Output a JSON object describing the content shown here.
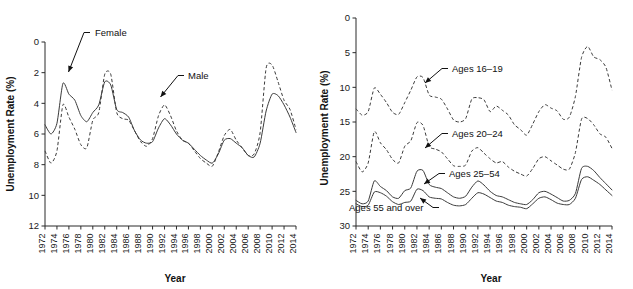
{
  "figure": {
    "panels": [
      "left",
      "right"
    ],
    "background": "#ffffff",
    "ink": "#1a1a1a"
  },
  "chart_data": [
    {
      "id": "unemployment-by-sex",
      "type": "line",
      "title": "",
      "xlabel": "Year",
      "ylabel": "Unemployment Rate (%)",
      "xlim": [
        1972,
        2014
      ],
      "ylim": [
        0,
        12
      ],
      "yticks": [
        0,
        2,
        4,
        6,
        8,
        10,
        12
      ],
      "xticks": [
        1972,
        1974,
        1976,
        1978,
        1980,
        1982,
        1984,
        1986,
        1988,
        1990,
        1992,
        1994,
        1996,
        1998,
        2000,
        2002,
        2004,
        2006,
        2008,
        2010,
        2012,
        2014
      ],
      "xtick_rotation": 90,
      "grid": false,
      "legend": "inline-annotations",
      "x": [
        1972,
        1973,
        1974,
        1975,
        1976,
        1977,
        1978,
        1979,
        1980,
        1981,
        1982,
        1983,
        1984,
        1985,
        1986,
        1987,
        1988,
        1989,
        1990,
        1991,
        1992,
        1993,
        1994,
        1995,
        1996,
        1997,
        1998,
        1999,
        2000,
        2001,
        2002,
        2003,
        2004,
        2005,
        2006,
        2007,
        2008,
        2009,
        2010,
        2011,
        2012,
        2013,
        2014
      ],
      "series": [
        {
          "name": "Female",
          "style": "solid",
          "annotation": "Female",
          "values": [
            6.6,
            6.0,
            6.7,
            9.3,
            8.6,
            8.2,
            7.2,
            6.8,
            7.4,
            7.9,
            9.4,
            9.2,
            7.6,
            7.4,
            7.1,
            6.2,
            5.6,
            5.4,
            5.5,
            6.4,
            7.0,
            6.6,
            6.0,
            5.6,
            5.4,
            5.0,
            4.6,
            4.3,
            4.1,
            4.7,
            5.6,
            5.7,
            5.4,
            5.1,
            4.6,
            4.5,
            5.4,
            7.5,
            8.6,
            8.5,
            7.9,
            7.1,
            6.1
          ]
        },
        {
          "name": "Male",
          "style": "dashed",
          "annotation": "Male",
          "values": [
            4.9,
            4.1,
            4.9,
            7.9,
            7.1,
            6.3,
            5.3,
            5.1,
            6.9,
            7.4,
            9.9,
            9.9,
            7.4,
            7.0,
            6.9,
            6.2,
            5.5,
            5.2,
            5.7,
            7.2,
            7.9,
            7.2,
            6.2,
            5.6,
            5.4,
            4.9,
            4.4,
            4.1,
            3.9,
            4.8,
            5.9,
            6.3,
            5.6,
            5.1,
            4.6,
            4.7,
            6.1,
            10.3,
            10.5,
            9.4,
            8.2,
            7.6,
            6.3
          ]
        }
      ]
    },
    {
      "id": "unemployment-by-age",
      "type": "line",
      "title": "",
      "xlabel": "Year",
      "ylabel": "Unemployment Rate (%)",
      "xlim": [
        1972,
        2014
      ],
      "ylim": [
        0,
        30
      ],
      "yticks": [
        0,
        5,
        10,
        15,
        20,
        25,
        30
      ],
      "xticks": [
        1972,
        1974,
        1976,
        1978,
        1980,
        1982,
        1984,
        1986,
        1988,
        1990,
        1992,
        1994,
        1996,
        1998,
        2000,
        2002,
        2004,
        2006,
        2008,
        2010,
        2012,
        2014
      ],
      "xtick_rotation": 90,
      "grid": false,
      "legend": "inline-annotations",
      "x": [
        1972,
        1973,
        1974,
        1975,
        1976,
        1977,
        1978,
        1979,
        1980,
        1981,
        1982,
        1983,
        1984,
        1985,
        1986,
        1987,
        1988,
        1989,
        1990,
        1991,
        1992,
        1993,
        1994,
        1995,
        1996,
        1997,
        1998,
        1999,
        2000,
        2001,
        2002,
        2003,
        2004,
        2005,
        2006,
        2007,
        2008,
        2009,
        2010,
        2011,
        2012,
        2013,
        2014
      ],
      "series": [
        {
          "name": "Ages 16-19",
          "style": "dashed",
          "annotation": "Ages 16–19",
          "values": [
            16.9,
            16.0,
            16.5,
            19.9,
            19.0,
            17.8,
            16.4,
            16.1,
            17.8,
            19.6,
            21.5,
            21.4,
            18.9,
            18.6,
            18.3,
            16.9,
            15.3,
            15.0,
            15.5,
            18.3,
            18.5,
            18.2,
            16.5,
            17.3,
            16.7,
            16.0,
            14.6,
            13.9,
            13.1,
            14.7,
            16.5,
            17.5,
            17.0,
            16.6,
            15.4,
            15.7,
            18.7,
            24.3,
            25.9,
            24.4,
            24.0,
            22.9,
            19.6
          ]
        },
        {
          "name": "Ages 20-24",
          "style": "dashed",
          "annotation": "Ages 20–24",
          "values": [
            9.3,
            7.8,
            9.1,
            13.6,
            12.0,
            11.0,
            9.6,
            9.1,
            11.5,
            12.3,
            14.9,
            14.5,
            11.5,
            11.1,
            10.7,
            9.7,
            8.7,
            8.6,
            8.8,
            10.8,
            11.3,
            10.5,
            9.7,
            9.1,
            9.3,
            8.5,
            7.9,
            7.5,
            7.2,
            8.3,
            9.7,
            10.0,
            9.4,
            8.8,
            8.2,
            8.2,
            10.6,
            15.4,
            15.5,
            14.6,
            13.3,
            12.8,
            11.2
          ]
        },
        {
          "name": "Ages 25-54",
          "style": "solid",
          "annotation": "Ages 25–54",
          "values": [
            3.7,
            3.2,
            3.6,
            6.5,
            5.7,
            5.1,
            4.2,
            4.0,
            5.1,
            5.5,
            7.9,
            8.0,
            6.0,
            5.6,
            5.4,
            4.8,
            4.2,
            4.0,
            4.3,
            5.6,
            6.5,
            5.9,
            5.0,
            4.4,
            4.2,
            3.8,
            3.4,
            3.2,
            3.1,
            3.8,
            4.8,
            5.0,
            4.6,
            4.1,
            3.6,
            3.7,
            4.7,
            8.3,
            8.6,
            8.0,
            7.0,
            6.1,
            5.2
          ]
        },
        {
          "name": "Ages 55 and over",
          "style": "solid",
          "annotation": "Ages 55 and over",
          "values": [
            3.2,
            2.8,
            3.0,
            4.9,
            4.8,
            4.3,
            3.5,
            3.1,
            3.4,
            3.6,
            5.3,
            5.1,
            4.2,
            4.0,
            3.9,
            3.4,
            3.0,
            2.9,
            3.1,
            4.0,
            4.8,
            4.6,
            4.1,
            3.6,
            3.4,
            3.0,
            2.8,
            2.7,
            2.5,
            3.2,
            4.0,
            4.2,
            3.8,
            3.3,
            3.1,
            3.1,
            4.0,
            6.7,
            7.1,
            6.6,
            6.0,
            5.2,
            4.4
          ]
        }
      ]
    }
  ],
  "panel_left": {
    "ylabel": "Unemployment Rate (%)",
    "xlabel": "Year",
    "annotations": [
      {
        "key": "female",
        "text": "Female"
      },
      {
        "key": "male",
        "text": "Male"
      }
    ],
    "ytick_labels": [
      "12",
      "10",
      "8",
      "6",
      "4",
      "2",
      "0"
    ],
    "xtick_labels": [
      "1972",
      "1974",
      "1976",
      "1978",
      "1980",
      "1982",
      "1984",
      "1986",
      "1988",
      "1990",
      "1992",
      "1994",
      "1996",
      "1998",
      "2000",
      "2002",
      "2004",
      "2006",
      "2008",
      "2010",
      "2012",
      "2014"
    ]
  },
  "panel_right": {
    "ylabel": "Unemployment Rate (%)",
    "xlabel": "Year",
    "annotations": [
      {
        "key": "ages-16-19",
        "text": "Ages 16–19"
      },
      {
        "key": "ages-20-24",
        "text": "Ages 20–24"
      },
      {
        "key": "ages-25-54",
        "text": "Ages 25–54"
      },
      {
        "key": "ages-55-over",
        "text": "Ages 55 and over"
      }
    ],
    "ytick_labels": [
      "30",
      "25",
      "20",
      "15",
      "10",
      "5",
      "0"
    ],
    "xtick_labels": [
      "1972",
      "1974",
      "1976",
      "1978",
      "1980",
      "1982",
      "1984",
      "1986",
      "1988",
      "1990",
      "1992",
      "1994",
      "1996",
      "1998",
      "2000",
      "2002",
      "2004",
      "2006",
      "2008",
      "2010",
      "2012",
      "2014"
    ]
  }
}
